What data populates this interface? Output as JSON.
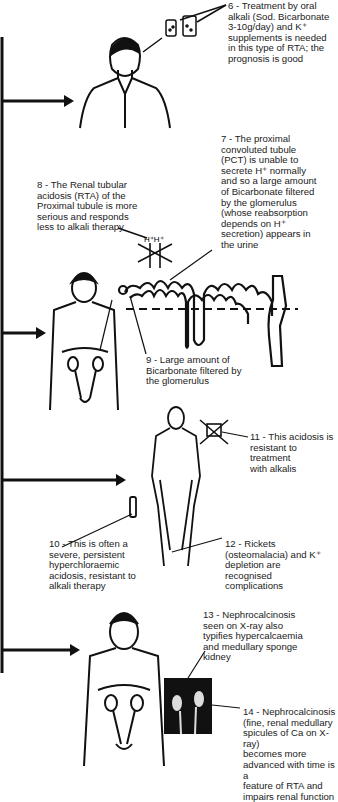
{
  "notes": {
    "n6": "6 - Treatment by oral\nalkali (Sod. Bicarbonate\n3-10g/day) and K⁺\nsupplements is needed\nin this type of RTA; the\nprognosis is good",
    "n7": "7 - The proximal\nconvoluted tubule\n(PCT) is unable to\nsecrete H⁺ normally\nand so a large amount\nof Bicarbonate filtered\nby the glomerulus\n(whose reabsorption\ndepends on H⁺\nsecretion) appears in\nthe urine",
    "n8": "8 - The Renal tubular\nacidosis (RTA) of the\nProximal tubule is more\nserious and responds\nless to alkali therapy",
    "n9": "9 - Large amount of\nBicarbonate filtered by\nthe glomerulus",
    "n10": "10 - This is often a\nsevere, persistent\nhyperchloraemic\nacidosis, resistant to\nalkali therapy",
    "n11": "11 - This acidosis is\nresistant to treatment\nwith alkalis",
    "n12": "12 - Rickets\n(osteomalacia) and K⁺\ndepletion are\nrecognised\ncomplications",
    "n13": "13 - Nephrocalcinosis\nseen on X-ray also\ntypifies hypercalcaemia\nand medullary sponge\nkidney",
    "n14": "14 - Nephrocalcinosis\n(fine, renal medullary\nspicules of Ca on X-ray)\nbecomes more\nadvanced with time is a\nfeature of RTA and\nimpairs renal function"
  },
  "labels": {
    "h_ions": "H⁺H⁺"
  }
}
